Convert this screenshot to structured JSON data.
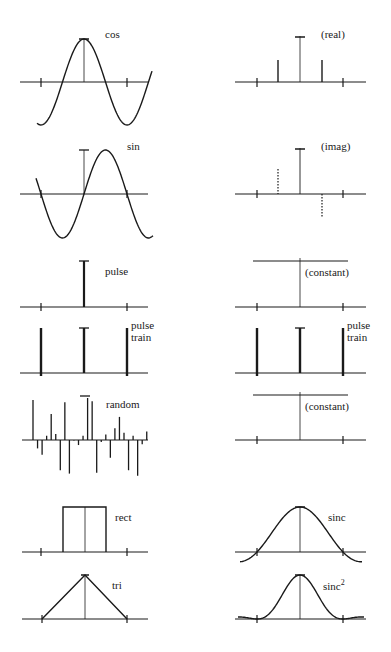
{
  "figure": {
    "rows": [
      {
        "left": {
          "label": "cos",
          "kind": "cos"
        },
        "right": {
          "label": "(real)",
          "kind": "delta-pair-real",
          "sub_label": ""
        }
      },
      {
        "left": {
          "label": "sin",
          "kind": "sin"
        },
        "right": {
          "label": "(imag)",
          "kind": "delta-pair-imag"
        }
      },
      {
        "left": {
          "label": "pulse",
          "kind": "pulse"
        },
        "right": {
          "label": "(constant)",
          "kind": "constant"
        }
      },
      {
        "left": {
          "label_line1": "pulse",
          "label_line2": "train",
          "kind": "pulse-train"
        },
        "right": {
          "label_line1": "pulse",
          "label_line2": "train",
          "kind": "pulse-train"
        }
      },
      {
        "left": {
          "label": "random",
          "kind": "random",
          "samples": [
            0.95,
            -0.2,
            -0.35,
            0.1,
            0.62,
            0.14,
            -0.72,
            0.9,
            -0.8,
            -0.01,
            -0.12,
            0.1,
            1.0,
            0.92,
            -0.78,
            -0.05,
            0.13,
            -0.42,
            0.28,
            0.55,
            0.17,
            -0.72,
            0.1,
            -0.85,
            -0.1,
            0.2
          ]
        },
        "right": {
          "label": "(constant)",
          "kind": "constant"
        }
      },
      {
        "left": {
          "label": "rect",
          "kind": "rect"
        },
        "right": {
          "label": "sinc",
          "kind": "sinc"
        }
      },
      {
        "left": {
          "label": "tri",
          "kind": "tri"
        },
        "right": {
          "label": "sinc",
          "label_sup": "2",
          "kind": "sinc2"
        }
      }
    ]
  }
}
